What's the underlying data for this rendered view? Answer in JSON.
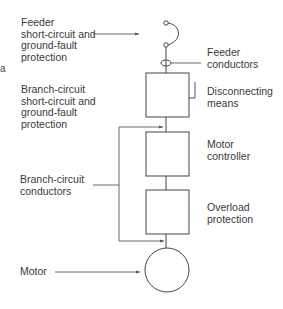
{
  "diagram": {
    "type": "motor circuit one-line diagram",
    "labels": {
      "feeder_protection": [
        "Feeder",
        "short-circuit and",
        "ground-fault",
        "protection"
      ],
      "feeder_conductors": [
        "Feeder",
        "conductors"
      ],
      "disconnecting_means": [
        "Disconnecting",
        "means"
      ],
      "branch_protection": [
        "Branch-circuit",
        "short-circuit and",
        "ground-fault",
        "protection"
      ],
      "motor_controller": [
        "Motor",
        "controller"
      ],
      "branch_conductors": [
        "Branch-circuit",
        "conductors"
      ],
      "overload_protection": [
        "Overload",
        "protection"
      ],
      "motor": [
        "Motor"
      ]
    },
    "stray_glyph": "a",
    "colors": {
      "line": "#444444",
      "text": "#3a3a3a",
      "background": "#ffffff"
    }
  }
}
